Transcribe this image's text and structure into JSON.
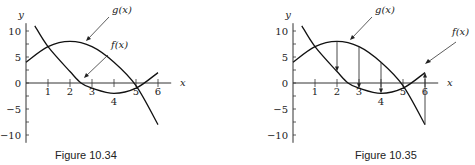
{
  "chart_data": [
    {
      "type": "line",
      "title": "",
      "caption": "Figure 10.34",
      "xlabel": "x",
      "ylabel": "y",
      "xlim": [
        0,
        6.5
      ],
      "ylim": [
        -11,
        11
      ],
      "x_ticks": [
        1,
        2,
        3,
        4,
        5,
        6
      ],
      "y_ticks": [
        -10,
        -5,
        0,
        5,
        10
      ],
      "grid": false,
      "series": [
        {
          "name": "g(x)",
          "x": [
            0,
            1,
            2,
            3,
            4,
            5,
            6
          ],
          "values": [
            4,
            7,
            8,
            7,
            4,
            -0.5,
            -8
          ]
        },
        {
          "name": "f(x)",
          "x": [
            0.4,
            1,
            2,
            2.5,
            3,
            4,
            5,
            6
          ],
          "values": [
            11,
            7,
            2.2,
            0,
            -1,
            -2,
            -1,
            2
          ]
        }
      ],
      "annotations": [
        {
          "label": "g(x)",
          "points_to": [
            3.5,
            7.5
          ]
        },
        {
          "label": "f(x)",
          "points_to": [
            2.7,
            1.0
          ]
        }
      ]
    },
    {
      "type": "line",
      "title": "",
      "caption": "Figure 10.35",
      "xlabel": "x",
      "ylabel": "y",
      "xlim": [
        0,
        6.5
      ],
      "ylim": [
        -11,
        11
      ],
      "x_ticks": [
        1,
        2,
        3,
        4,
        5,
        6
      ],
      "y_ticks": [
        -10,
        -5,
        0,
        5,
        10
      ],
      "grid": false,
      "series": [
        {
          "name": "g(x)",
          "x": [
            0,
            1,
            2,
            3,
            4,
            5,
            6
          ],
          "values": [
            4,
            7,
            8,
            7,
            4,
            -0.5,
            -8
          ]
        },
        {
          "name": "f(x)",
          "x": [
            0.4,
            1,
            2,
            2.5,
            3,
            4,
            5,
            6
          ],
          "values": [
            11,
            7,
            2.2,
            0,
            -1,
            -2,
            -1,
            2
          ]
        }
      ],
      "vertical_arrows": [
        {
          "x": 2,
          "from": 8,
          "to": 2.2
        },
        {
          "x": 3,
          "from": 7,
          "to": -1
        },
        {
          "x": 4,
          "from": 4,
          "to": -2
        },
        {
          "x": 6,
          "from": -8,
          "to": 2
        }
      ],
      "annotations": [
        {
          "label": "g(x)",
          "points_to": [
            2.7,
            7.8
          ]
        },
        {
          "label": "f(x)",
          "points_to": [
            6,
            3
          ]
        }
      ]
    }
  ],
  "figures": {
    "left": {
      "caption": "Figure 10.34",
      "g_label": "g(x)",
      "f_label": "f(x)",
      "xlabel": "x",
      "ylabel": "y"
    },
    "right": {
      "caption": "Figure 10.35",
      "g_label": "g(x)",
      "f_label": "f(x)",
      "xlabel": "x",
      "ylabel": "y"
    }
  }
}
